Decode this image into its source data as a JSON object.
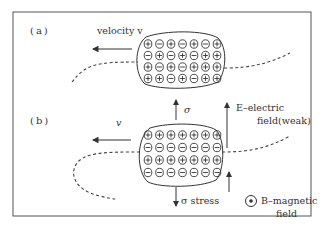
{
  "figure": {
    "panels": [
      {
        "id": "a",
        "label": "(a)",
        "velocity_label": "velocity v",
        "rows": [
          [
            "plus",
            "minus",
            "plus",
            "minus",
            "plus",
            "minus",
            "plus"
          ],
          [
            "minus",
            "plus",
            "minus",
            "plus",
            "minus",
            "plus",
            "plus"
          ],
          [
            "plus",
            "minus",
            "plus",
            "minus",
            "plus",
            "plus",
            "plus"
          ],
          [
            "plus",
            "plus",
            "minus",
            "plus",
            "minus",
            "plus",
            "plus"
          ]
        ]
      },
      {
        "id": "b",
        "label": "(b)",
        "velocity_label": "v",
        "rows": [
          [
            "plus",
            "plus",
            "plus",
            "plus",
            "plus",
            "plus",
            "plus"
          ],
          [
            "minus",
            "minus",
            "minus",
            "minus",
            "minus",
            "minus",
            "minus"
          ],
          [
            "plus",
            "plus",
            "plus",
            "plus",
            "plus",
            "plus",
            "plus"
          ],
          [
            "minus",
            "minus",
            "minus",
            "minus",
            "minus",
            "minus",
            "minus"
          ]
        ]
      }
    ],
    "annotations": {
      "sigma_up": "σ",
      "sigma_stress": "σ stress",
      "e_field_line1": "E–electric",
      "e_field_line2": "field(weak)",
      "b_field_line1": "B–magnetic",
      "b_field_line2": "field"
    },
    "colors": {
      "ink": "#3a3a3a",
      "frame": "#555555"
    }
  }
}
